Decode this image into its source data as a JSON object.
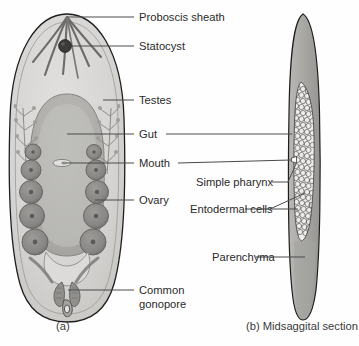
{
  "figure": {
    "title_a": "(a)",
    "title_b": "(b)  Midsaggital section",
    "caption_a_letter": "(a)",
    "caption_b_letter": "(b)",
    "caption_b_text": "Midsaggital section"
  },
  "labels": {
    "proboscis_sheath": "Proboscis sheath",
    "statocyst": "Statocyst",
    "testes": "Testes",
    "gut": "Gut",
    "mouth": "Mouth",
    "ovary": "Ovary",
    "common_gonopore_line1": "Common",
    "common_gonopore_line2": "gonopore",
    "simple_pharynx": "Simple pharynx",
    "entodermal_cells": "Entodermal cells",
    "parenchyma": "Parenchyma"
  },
  "colors": {
    "background": "#ffffff",
    "body_fill": "#d5d4d2",
    "body_inner_fill": "#c9c8c5",
    "gut_fill": "#b0afac",
    "gut_inner_fill": "#a9a8a5",
    "gonad_fill": "#8d8c8a",
    "gonad_dark": "#6f6e6c",
    "statocyst_fill": "#3a3a3a",
    "outline_stroke": "#1e1e1e",
    "leader_stroke": "#4a4a4a",
    "text_fill": "#2b2b2b",
    "section_body_fill": "#a8a7a4",
    "section_cells_fill": "#efeeec",
    "cell_stroke": "#555555"
  },
  "diagram_a": {
    "name": "whole-mount-dorsal-view",
    "parts": [
      "body-outline",
      "proboscis-sheath-rays",
      "statocyst",
      "gut",
      "mouth",
      "testes-left",
      "testes-right",
      "ovaries-left",
      "ovaries-right",
      "common-gonopore"
    ]
  },
  "diagram_b": {
    "name": "midsaggital-section",
    "parts": [
      "section-body-outline",
      "parenchyma",
      "entodermal-cell-mass",
      "simple-pharynx-opening"
    ]
  }
}
